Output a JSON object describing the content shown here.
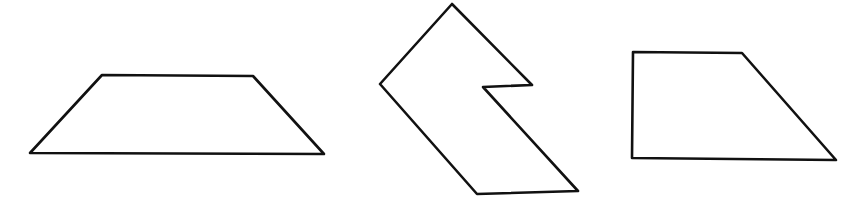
{
  "diagram": {
    "background": "#ffffff",
    "stroke_color": "#111111",
    "shapes": [
      {
        "name": "trapezoid",
        "points": "102,75 253,76 324,154 30,153"
      },
      {
        "name": "notched-parallelogram",
        "points": "452,4 532,85 483,87 578,191 477,194 380,84"
      },
      {
        "name": "right-trapezoid",
        "points": "633,52 742,53 836,160 632,158"
      }
    ]
  }
}
